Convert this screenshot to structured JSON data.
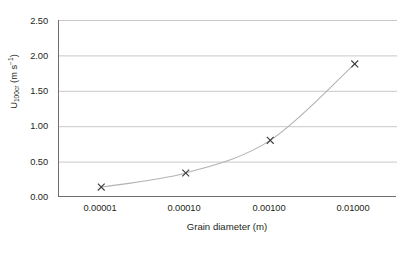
{
  "chart_data": {
    "type": "line",
    "title": "",
    "subtitle": "",
    "xlabel": "Grain diameter (m)",
    "ylabel_parts": {
      "symbol": "U",
      "subscript": "100cr",
      "units": " (m s",
      "superscript": "−1",
      "units_close": ")"
    },
    "ylabel": "U100cr (m s-1)",
    "x": [
      1e-05,
      0.0001,
      0.001,
      0.01
    ],
    "x_tick_labels": [
      "0.00001",
      "0.00010",
      "0.00100",
      "0.01000"
    ],
    "xscale": "log",
    "xlim": [
      3.162e-06,
      0.0316228
    ],
    "values": [
      0.14,
      0.34,
      0.8,
      1.88
    ],
    "y_tick_labels": [
      "2.50",
      "2.00",
      "1.50",
      "1.00",
      "0.50",
      "0.00"
    ],
    "y_ticks": [
      2.5,
      2.0,
      1.5,
      1.0,
      0.5,
      0.0
    ],
    "ylim": [
      0.0,
      2.5
    ],
    "grid": "horizontal",
    "legend": "none",
    "marker": "x",
    "marker_color": "#3a3a3a",
    "line_color": "#b3b3b3",
    "gridline_color": "#c9c9c9",
    "axis_color": "#6d6e71",
    "background_color": "#ffffff",
    "text_color": "#231f20",
    "series": [
      {
        "name": "U100cr",
        "points": [
          {
            "x": 1e-05,
            "y": 0.14
          },
          {
            "x": 0.0001,
            "y": 0.34
          },
          {
            "x": 0.001,
            "y": 0.8
          },
          {
            "x": 0.01,
            "y": 1.88
          }
        ]
      }
    ]
  }
}
